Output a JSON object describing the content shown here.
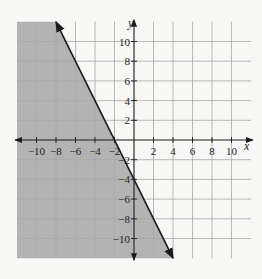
{
  "chart_data": {
    "type": "line",
    "title": "",
    "xlabel": "x",
    "ylabel": "y",
    "xlim": [
      -12,
      12
    ],
    "ylim": [
      -12,
      12
    ],
    "grid": true,
    "grid_step": 2,
    "x_ticks": [
      -10,
      -8,
      -6,
      -4,
      -2,
      2,
      4,
      6,
      8,
      10
    ],
    "y_ticks": [
      10,
      8,
      6,
      4,
      2,
      -2,
      -4,
      -6,
      -8,
      -10
    ],
    "x_tick_labels": [
      "−10",
      "−8",
      "−6",
      "−4",
      "−2",
      "2",
      "4",
      "6",
      "8",
      "10"
    ],
    "y_tick_labels": [
      "10",
      "8",
      "6",
      "4",
      "2",
      "−2",
      "−4",
      "−6",
      "−8",
      "−10"
    ],
    "series": [
      {
        "name": "boundary line y = -2x - 4",
        "style": "solid",
        "arrows": "both",
        "x": [
          -8,
          4
        ],
        "y": [
          12,
          -12
        ]
      }
    ],
    "shaded_region": {
      "inequality": "y ≤ -2x - 4",
      "side": "left/below line",
      "color": "#b3b3b3"
    },
    "colors": {
      "background": "#f7f7f5",
      "shade": "#b3b3b3",
      "grid": "#a8a8a8",
      "line": "#1a1a1a"
    }
  }
}
